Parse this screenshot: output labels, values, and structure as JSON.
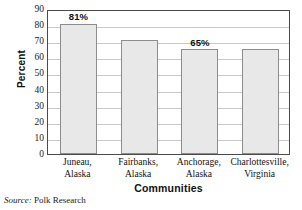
{
  "chart_data": {
    "type": "bar",
    "title": "",
    "xlabel": "Communities",
    "ylabel": "Percent",
    "categories": [
      "Juneau, Alaska",
      "Fairbanks, Alaska",
      "Anchorage, Alaska",
      "Charlottesville, Virginia"
    ],
    "category_lines": [
      [
        "Juneau,",
        "Alaska"
      ],
      [
        "Fairbanks,",
        "Alaska"
      ],
      [
        "Anchorage,",
        "Alaska"
      ],
      [
        "Charlottesville,",
        "Virginia"
      ]
    ],
    "values": [
      81,
      71,
      65,
      65
    ],
    "data_labels": [
      "81%",
      "",
      "65%",
      ""
    ],
    "ylim": [
      0,
      90
    ],
    "yticks": [
      0,
      10,
      20,
      30,
      40,
      50,
      60,
      70,
      80,
      90
    ],
    "ytick_labels": [
      "0",
      "10",
      "20",
      "30",
      "40",
      "50",
      "60",
      "70",
      "80",
      "90"
    ],
    "grid": true,
    "grid_axis": "y",
    "legend": false,
    "legend_position": "none",
    "bar_fill_color": "#e8e8e8",
    "bar_edge_color": "#8d8d8d",
    "grid_color": "#c9c9c9",
    "axis_color": "#4a4a4a"
  },
  "source": {
    "label": "Source:",
    "text": "Polk Research"
  }
}
